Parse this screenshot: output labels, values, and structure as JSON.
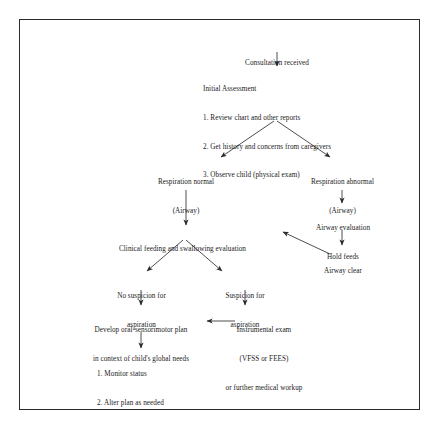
{
  "document": {
    "title": "Clinical feeding and swallowing evaluation flowchart",
    "border_color": "#2b2b2b",
    "text_color": "#1a1a1a",
    "background": "#ffffff"
  },
  "nodes": {
    "consultation": {
      "id": "consultation-received",
      "lines": [
        "Consultation received"
      ]
    },
    "initial_assessment": {
      "id": "initial-assessment",
      "lines": [
        "Initial Assessment",
        "1. Review chart and other reports",
        "2. Get history and concerns from caregivers",
        "3. Observe child (physical exam)"
      ]
    },
    "respiration_normal": {
      "id": "respiration-normal",
      "lines": [
        "Respiration normal",
        "(Airway)"
      ]
    },
    "respiration_abnormal": {
      "id": "respiration-abnormal",
      "lines": [
        "Respiration abnormal",
        "(Airway)"
      ]
    },
    "airway_evaluation": {
      "id": "airway-evaluation",
      "lines": [
        "Airway evaluation",
        "Hold feeds"
      ]
    },
    "airway_clear": {
      "id": "airway-clear",
      "lines": [
        "Airway clear"
      ]
    },
    "clinical_feeding": {
      "id": "clinical-feeding-and-swallowing-evaluation",
      "lines": [
        "Clinical feeding and swallowing evaluation"
      ]
    },
    "no_suspicion": {
      "id": "no-suspicion-for-aspiration",
      "lines": [
        "No suspicion for",
        "aspiration"
      ]
    },
    "suspicion": {
      "id": "suspicion-for-aspiration",
      "lines": [
        "Suspicion for",
        "aspiration"
      ]
    },
    "develop_plan": {
      "id": "develop-oral-sensorimotor-plan",
      "lines": [
        "Develop oral-sensorimotor plan",
        "in context of child's global needs"
      ]
    },
    "instrumental_exam": {
      "id": "instrumental-exam",
      "lines": [
        "Instrumental exam",
        "(VFSS or FEES)",
        "or further medical workup"
      ]
    },
    "monitor": {
      "id": "monitor-and-alter-plan",
      "lines": [
        "1. Monitor status",
        "2. Alter plan as needed"
      ]
    }
  },
  "connectors": [
    {
      "id": "consultation-to-initial-assessment",
      "type": "arrow-down"
    },
    {
      "id": "initial-assessment-to-respiration-normal",
      "type": "arrow-diagonal-left"
    },
    {
      "id": "initial-assessment-to-respiration-abnormal",
      "type": "arrow-diagonal-right"
    },
    {
      "id": "respiration-normal-to-clinical-feeding",
      "type": "arrow-down-long"
    },
    {
      "id": "respiration-abnormal-to-airway-evaluation",
      "type": "arrow-down"
    },
    {
      "id": "airway-evaluation-to-airway-clear",
      "type": "arrow-down"
    },
    {
      "id": "airway-clear-to-clinical-feeding",
      "type": "arrow-diagonal-up-left"
    },
    {
      "id": "clinical-feeding-to-no-suspicion",
      "type": "arrow-diagonal-left"
    },
    {
      "id": "clinical-feeding-to-suspicion",
      "type": "arrow-diagonal-right"
    },
    {
      "id": "no-suspicion-to-develop-plan",
      "type": "arrow-down"
    },
    {
      "id": "suspicion-to-instrumental-exam",
      "type": "arrow-down"
    },
    {
      "id": "instrumental-exam-to-develop-plan",
      "type": "arrow-left"
    },
    {
      "id": "develop-plan-to-monitor",
      "type": "arrow-down"
    }
  ]
}
